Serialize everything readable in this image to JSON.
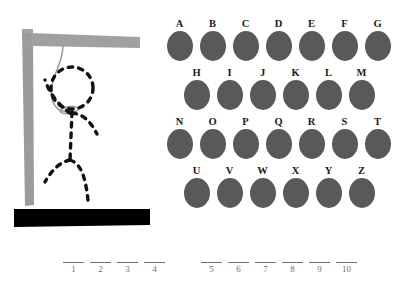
{
  "game": {
    "title": "Hangman",
    "colors": {
      "disc": "#595959",
      "gallows": "#999999",
      "base": "#000000",
      "figure": "#111111",
      "rope": "#9a9a9a",
      "blank_line": "#6e6e6e",
      "background": "#ffffff"
    }
  },
  "gallows": {
    "post_name": "gallows-post",
    "beam_name": "gallows-beam",
    "base_name": "gallows-base",
    "rope_name": "hangman-rope",
    "figure_parts": [
      "head",
      "torso",
      "left-arm",
      "right-arm",
      "left-leg",
      "right-leg"
    ],
    "figure_complete": true
  },
  "alphabet": {
    "rows": [
      {
        "indented": false,
        "letters": [
          "A",
          "B",
          "C",
          "D",
          "E",
          "F",
          "G"
        ]
      },
      {
        "indented": true,
        "letters": [
          "H",
          "I",
          "J",
          "K",
          "L",
          "M"
        ]
      },
      {
        "indented": false,
        "letters": [
          "N",
          "O",
          "P",
          "Q",
          "R",
          "S",
          "T"
        ]
      },
      {
        "indented": true,
        "letters": [
          "U",
          "V",
          "W",
          "X",
          "Y",
          "Z"
        ]
      }
    ]
  },
  "answer": {
    "groups": [
      {
        "name": "word-one",
        "slots": [
          "1",
          "2",
          "3",
          "4"
        ],
        "values": [
          "",
          "",
          "",
          ""
        ]
      },
      {
        "name": "word-two",
        "slots": [
          "5",
          "6",
          "7",
          "8",
          "9",
          "10"
        ],
        "values": [
          "",
          "",
          "",
          "",
          "",
          ""
        ]
      }
    ]
  }
}
